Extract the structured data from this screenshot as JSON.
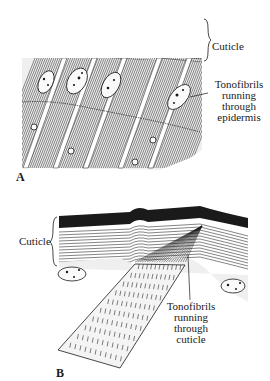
{
  "figure": {
    "panels": [
      {
        "id": "A",
        "letter": "A",
        "labels": {
          "cuticle": "Cuticle",
          "tonofibrils_lines": [
            "Tonofibrils",
            "running",
            "through",
            "epidermis"
          ]
        }
      },
      {
        "id": "B",
        "letter": "B",
        "labels": {
          "cuticle": "Cuticle",
          "tonofibrils_lines": [
            "Tonofibrils",
            "running",
            "through",
            "cuticle"
          ]
        }
      }
    ],
    "colors": {
      "ink": "#1a1a1a",
      "paper": "#ffffff",
      "stipple": "#8a8a8a"
    }
  }
}
